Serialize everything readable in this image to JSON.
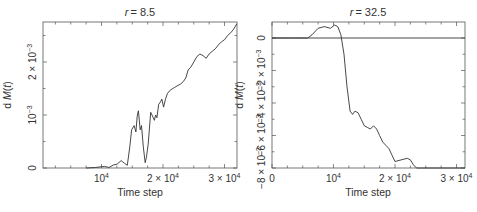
{
  "chart_data": [
    {
      "type": "line",
      "title": "r = 8.5",
      "title_var": "r",
      "title_value": "= 8.5",
      "xlabel": "Time step",
      "ylabel": "d M(t)",
      "xlim": [
        0,
        32000
      ],
      "ylim": [
        0,
        0.00275
      ],
      "xticks": [
        10000,
        20000,
        30000
      ],
      "xtick_labels": [
        "10",
        "2 × 10",
        "3 × 10"
      ],
      "xtick_exp": "4",
      "yticks": [
        0,
        0.001,
        0.002
      ],
      "ytick_labels": [
        "0",
        "10",
        "2 × 10"
      ],
      "ytick_exp": "−3",
      "grid": false,
      "series": [
        {
          "name": "dM(t), r=8.5",
          "x": [
            7500,
            9000,
            10500,
            11200,
            12000,
            12500,
            13200,
            13700,
            14200,
            14600,
            14900,
            15300,
            15600,
            15800,
            16000,
            16300,
            16500,
            16800,
            17100,
            17300,
            17600,
            18000,
            18300,
            18600,
            18800,
            19000,
            19300,
            19600,
            19800,
            20100,
            20400,
            20700,
            21000,
            21300,
            21600,
            21900,
            22300,
            22800,
            23300,
            23700,
            24100,
            24500,
            25000,
            25500,
            26000,
            26500,
            27000,
            27500,
            28000,
            28500,
            29000,
            29500,
            30000,
            30500,
            31000,
            31500,
            32000
          ],
          "y": [
            0.0,
            1e-05,
            3e-05,
            1e-05,
            6e-05,
            7e-05,
            0.00014,
            9e-05,
            5e-05,
            0.0004,
            0.00072,
            0.0008,
            0.00068,
            0.00098,
            0.00108,
            0.00072,
            0.0008,
            0.0004,
            0.0001,
            0.0002,
            0.00045,
            0.00105,
            0.00098,
            0.0009,
            0.001,
            0.00095,
            0.0012,
            0.00125,
            0.0013,
            0.00115,
            0.0013,
            0.0014,
            0.00145,
            0.00148,
            0.0015,
            0.00152,
            0.00155,
            0.00158,
            0.00163,
            0.0017,
            0.00185,
            0.0019,
            0.002,
            0.0021,
            0.00215,
            0.00212,
            0.00207,
            0.00215,
            0.0022,
            0.00225,
            0.00232,
            0.00238,
            0.00242,
            0.0025,
            0.00255,
            0.00262,
            0.00272
          ]
        }
      ]
    },
    {
      "type": "line",
      "title": "r = 32.5",
      "title_var": "r",
      "title_value": "= 32.5",
      "xlabel": "Time step",
      "ylabel": "d M(t)",
      "xlim": [
        0,
        32000
      ],
      "ylim": [
        -0.008,
        0.001
      ],
      "xticks": [
        0,
        10000,
        20000,
        30000
      ],
      "xtick_labels": [
        "0",
        "10",
        "2 × 10",
        "3 × 10"
      ],
      "xtick_exp": "4",
      "yticks": [
        0,
        -0.002,
        -0.004,
        -0.006,
        -0.008
      ],
      "ytick_labels": [
        "0",
        "−2 × 10",
        "−4 × 10",
        "−6 × 10",
        "−8 × 10"
      ],
      "ytick_exp": "−3",
      "reference_line_y": 0,
      "grid": false,
      "series": [
        {
          "name": "dM(t), r=32.5",
          "x": [
            0,
            3000,
            5800,
            6500,
            7500,
            8500,
            9500,
            10200,
            10700,
            11200,
            11700,
            12200,
            12700,
            13100,
            13500,
            14000,
            14500,
            15000,
            15500,
            16000,
            16500,
            17000,
            17500,
            18000,
            18500,
            19000,
            19500,
            20000,
            21000,
            22000,
            22500,
            23000,
            23500,
            24000,
            24500,
            25000,
            26000,
            27000,
            28000,
            29000,
            30000,
            30500,
            31000,
            32000
          ],
          "y": [
            0,
            0,
            0,
            0.0002,
            0.0006,
            0.0007,
            0.0006,
            0.0008,
            0.0007,
            0.0002,
            -0.001,
            -0.003,
            -0.0045,
            -0.0047,
            -0.0045,
            -0.0046,
            -0.005,
            -0.0054,
            -0.0055,
            -0.0056,
            -0.0054,
            -0.0056,
            -0.006,
            -0.0064,
            -0.0066,
            -0.0068,
            -0.0072,
            -0.0076,
            -0.0075,
            -0.0074,
            -0.0075,
            -0.0078,
            -0.0081,
            -0.0083,
            -0.0084,
            -0.0086,
            -0.0088,
            -0.0091,
            -0.0094,
            -0.0097,
            -0.0101,
            -0.01,
            -0.0099,
            -0.0099
          ]
        }
      ]
    }
  ]
}
